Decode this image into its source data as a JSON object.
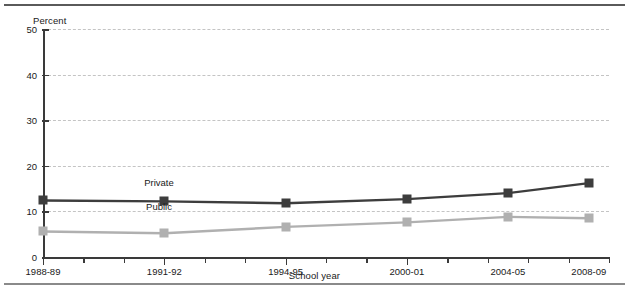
{
  "chart_data": {
    "type": "line",
    "title": "",
    "xlabel": "School year",
    "ylabel": "Percent",
    "ylim": [
      0,
      50
    ],
    "yticks": [
      0,
      10,
      20,
      30,
      40,
      50
    ],
    "grid": "horizontal-dashed",
    "legend": "inline-labels",
    "categories": [
      "1988-89",
      "1991-92",
      "1994-95",
      "2000-01",
      "2004-05",
      "2008-09"
    ],
    "x_positions_fraction": [
      0.0,
      0.2143,
      0.4286,
      0.6429,
      0.8214,
      0.9643
    ],
    "series": [
      {
        "name": "Private",
        "color": "#3d3d3d",
        "marker": "square",
        "values": [
          12.4,
          12.2,
          11.8,
          12.7,
          14.0,
          16.2
        ],
        "label": "Private",
        "label_x_fraction": 0.205,
        "label_y_value": 16.4
      },
      {
        "name": "Public",
        "color": "#b0b0b0",
        "marker": "square",
        "values": [
          5.6,
          5.2,
          6.6,
          7.6,
          8.8,
          8.5
        ],
        "label": "Public",
        "label_x_fraction": 0.205,
        "label_y_value": 11.1
      }
    ],
    "minor_ticks_per_interval": 3
  },
  "figure": {
    "percent_label": "Percent",
    "school_year_label": "School year"
  },
  "colors": {
    "private": "#3d3d3d",
    "public": "#b0b0b0",
    "axis": "#3a3a3a",
    "grid": "#c4c4c4",
    "rule_top": "#5a5a5a",
    "rule_bottom": "#8a8a8a",
    "text": "#1a1a1a",
    "background": "#ffffff"
  }
}
